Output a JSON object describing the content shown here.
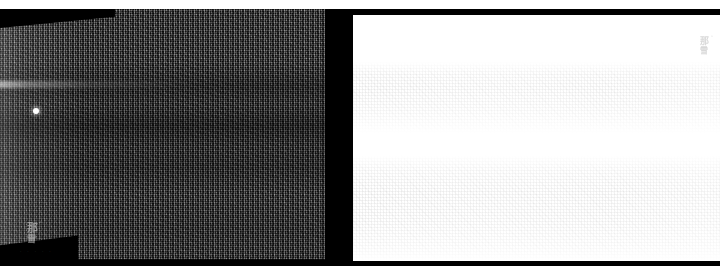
{
  "viewer": {
    "title": "dual-panel speckle image viewer",
    "width": 720,
    "height": 274,
    "background_color": "#ffffff",
    "stage_color": "#000000"
  },
  "left_panel": {
    "name": "original speckle image",
    "background_color": "#000000",
    "swath_fill_color": "#2b2b2b",
    "watermark": {
      "main_text": "那",
      "sub_text": "雪",
      "superscript_text": "^",
      "color": "#b9b9b9"
    },
    "caption_text": "· · · · ·",
    "point_target": {
      "name": "bright point target",
      "color": "#ffffff",
      "x": 33,
      "y": 108
    },
    "streak": {
      "name": "near-range bright streak",
      "color": "#ffffff"
    }
  },
  "right_panel": {
    "name": "inverted rendering",
    "background_color": "#ffffff",
    "border_color": "#000000",
    "watermark": {
      "main_text": "那",
      "sub_text": "雪",
      "superscript_text": "^",
      "color": "#d2d2d2"
    }
  }
}
